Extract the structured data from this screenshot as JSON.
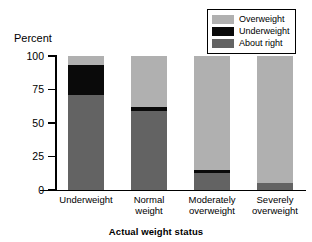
{
  "chart_data": {
    "type": "bar",
    "stacked": true,
    "title": "",
    "xlabel": "Actual weight status",
    "ylabel": "Percent",
    "categories": [
      "Underweight",
      "Normal weight",
      "Moderately overweight",
      "Severely overweight"
    ],
    "category_lines": [
      [
        "Underweight"
      ],
      [
        "Normal",
        "weight"
      ],
      [
        "Moderately",
        "overweight"
      ],
      [
        "Severely",
        "overweight"
      ]
    ],
    "ylim": [
      0,
      100
    ],
    "yticks": [
      0,
      25,
      50,
      75,
      100
    ],
    "ytick_labels": [
      "0",
      "25",
      "50",
      "75",
      "100"
    ],
    "grid": false,
    "legend_position": "top-right",
    "series": [
      {
        "name": "About right",
        "color": "#636363",
        "values": [
          71,
          59,
          13,
          5
        ]
      },
      {
        "name": "Underweight",
        "color": "#0a0a0a",
        "values": [
          22,
          3,
          2,
          0
        ]
      },
      {
        "name": "Overweight",
        "color": "#b0b0b0",
        "values": [
          7,
          38,
          85,
          95
        ]
      }
    ],
    "legend_order": [
      "Overweight",
      "Underweight",
      "About right"
    ]
  },
  "legend": {
    "items": [
      {
        "label": "Overweight",
        "color": "#b0b0b0"
      },
      {
        "label": "Underweight",
        "color": "#0a0a0a"
      },
      {
        "label": "About right",
        "color": "#636363"
      }
    ]
  },
  "colors": {
    "overweight": "#b0b0b0",
    "underweight": "#0a0a0a",
    "about_right": "#636363",
    "axis": "#000000",
    "background": "#ffffff"
  }
}
